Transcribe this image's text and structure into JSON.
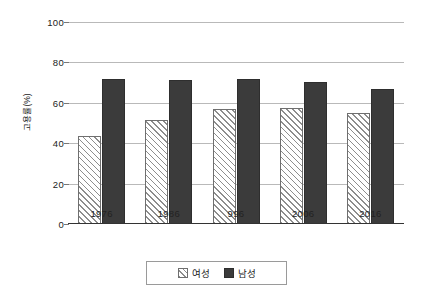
{
  "chart_data": {
    "type": "bar",
    "title": "",
    "xlabel": "",
    "ylabel": "고용률(%)",
    "categories": [
      "1976",
      "1986",
      "996",
      "2006",
      "2016"
    ],
    "series": [
      {
        "name": "여성",
        "values": [
          43.5,
          51.5,
          57.0,
          57.5,
          55.0
        ]
      },
      {
        "name": "남성",
        "values": [
          72.0,
          71.5,
          72.0,
          70.5,
          67.0
        ]
      }
    ],
    "ylim": [
      0,
      100
    ],
    "yticks": [
      0,
      20,
      40,
      60,
      80,
      100
    ],
    "ytick_labels": [
      "0",
      "20",
      "40",
      "60",
      "80",
      "100"
    ],
    "grid": true,
    "legend_position": "bottom",
    "colors": {
      "female_fill": "#ffffff",
      "female_hatch": "#8d8d8d",
      "male_fill": "#3b3b3b",
      "gridline": "#b9b9b9",
      "axis": "#333333",
      "text": "#1a1a1a"
    }
  }
}
